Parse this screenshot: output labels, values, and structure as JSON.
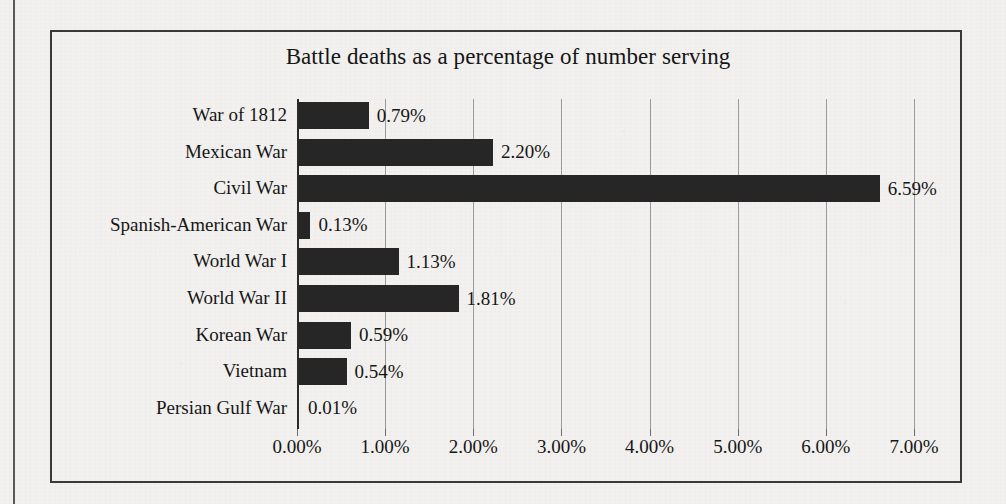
{
  "chart_data": {
    "type": "bar",
    "orientation": "horizontal",
    "title": "Battle deaths as a percentage of number serving",
    "xlabel": "",
    "ylabel": "",
    "categories": [
      "War of 1812",
      "Mexican War",
      "Civil War",
      "Spanish-American War",
      "World War I",
      "World War II",
      "Korean War",
      "Vietnam",
      "Persian Gulf War"
    ],
    "values": [
      0.79,
      2.2,
      6.59,
      0.13,
      1.13,
      1.81,
      0.59,
      0.54,
      0.01
    ],
    "data_labels": [
      "0.79%",
      "2.20%",
      "6.59%",
      "0.13%",
      "1.13%",
      "1.81%",
      "0.59%",
      "0.54%",
      "0.01%"
    ],
    "xlim": [
      0,
      7
    ],
    "xticks": [
      0,
      1,
      2,
      3,
      4,
      5,
      6,
      7
    ],
    "xtick_labels": [
      "0.00%",
      "1.00%",
      "2.00%",
      "3.00%",
      "4.00%",
      "5.00%",
      "6.00%",
      "7.00%"
    ],
    "grid": true,
    "grid_axis": "x",
    "legend": false,
    "bar_color": "#262626",
    "background_color": "#f4f3f1",
    "gridline_color": "#9c9c9c",
    "axis_color": "#2b2b2b",
    "frame_color": "#3a3a3a"
  }
}
